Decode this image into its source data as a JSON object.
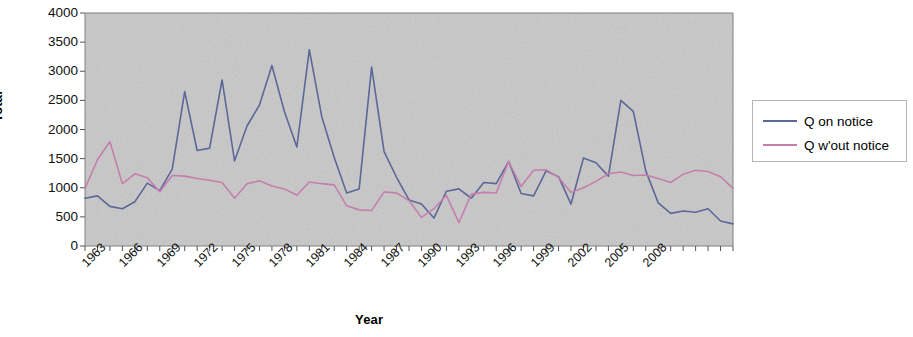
{
  "chart_data": {
    "type": "line",
    "title": "",
    "xlabel": "Year",
    "ylabel": "Total",
    "xlim": [
      1963,
      2015
    ],
    "ylim": [
      0,
      4000
    ],
    "ytick_step": 500,
    "yticks": [
      0,
      500,
      1000,
      1500,
      2000,
      2500,
      3000,
      3500,
      4000
    ],
    "ytick_labels": [
      "0",
      "500",
      "1000",
      "1500",
      "2000",
      "2500",
      "3000",
      "3500",
      "4000"
    ],
    "xticks_labeled": [
      1963,
      1966,
      1969,
      1972,
      1975,
      1978,
      1981,
      1984,
      1987,
      1990,
      1993,
      1996,
      1999,
      2002,
      2005,
      2008
    ],
    "xtick_labels": [
      "1963",
      "1966",
      "1969",
      "1972",
      "1975",
      "1978",
      "1981",
      "1984",
      "1987",
      "1990",
      "1993",
      "1996",
      "1999",
      "2002",
      "2005",
      "2008"
    ],
    "x": [
      1963,
      1964,
      1965,
      1966,
      1967,
      1968,
      1969,
      1970,
      1971,
      1972,
      1973,
      1974,
      1975,
      1976,
      1977,
      1978,
      1979,
      1980,
      1981,
      1982,
      1983,
      1984,
      1985,
      1986,
      1987,
      1988,
      1989,
      1990,
      1991,
      1992,
      1993,
      1994,
      1995,
      1996,
      1997,
      1998,
      1999,
      2000,
      2001,
      2002,
      2003,
      2004,
      2005,
      2006,
      2007,
      2008,
      2009,
      2010,
      2011,
      2012,
      2013,
      2014,
      2015
    ],
    "grid": false,
    "legend_position": "right",
    "series": [
      {
        "name": "Q on notice",
        "color": "#5b6899",
        "values": [
          820,
          860,
          680,
          640,
          760,
          1080,
          950,
          1320,
          2650,
          1640,
          1680,
          2850,
          1460,
          2060,
          2420,
          3100,
          2310,
          1700,
          3370,
          2220,
          1520,
          910,
          980,
          3070,
          1620,
          1180,
          790,
          720,
          480,
          940,
          980,
          820,
          1090,
          1070,
          1450,
          900,
          860,
          1290,
          1190,
          720,
          1510,
          1430,
          1200,
          2500,
          2310,
          1290,
          740,
          560,
          600,
          580,
          640,
          430,
          380
        ]
      },
      {
        "name": "Q w'out notice",
        "color": "#c57fad",
        "values": [
          990,
          1480,
          1790,
          1070,
          1240,
          1170,
          930,
          1210,
          1200,
          1160,
          1130,
          1090,
          820,
          1070,
          1120,
          1030,
          980,
          870,
          1100,
          1070,
          1050,
          690,
          620,
          610,
          930,
          910,
          780,
          490,
          640,
          870,
          400,
          890,
          920,
          910,
          1450,
          1020,
          1300,
          1310,
          1180,
          920,
          1000,
          1110,
          1240,
          1270,
          1210,
          1220,
          1160,
          1090,
          1230,
          1300,
          1280,
          1190,
          990
        ]
      }
    ]
  },
  "legend": {
    "items": [
      {
        "label": "Q on notice",
        "color": "#5b6899"
      },
      {
        "label": "Q w'out notice",
        "color": "#c57fad"
      }
    ]
  },
  "plot": {
    "background_color": "#c8c8c8",
    "border_color": "#808080"
  }
}
